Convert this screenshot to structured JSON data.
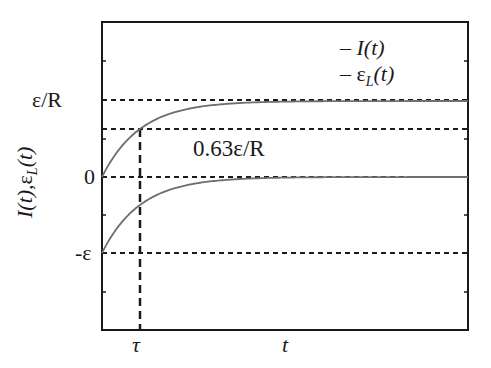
{
  "chart_data": {
    "type": "line",
    "title": "",
    "xlabel": "t",
    "ylabel": "I(t), ε_L(t)",
    "x_ticks": [
      {
        "label": "τ",
        "value": 1
      },
      {
        "label": "t",
        "value": 4
      }
    ],
    "y_ticks": [
      {
        "label": "ε/R",
        "value": 1
      },
      {
        "label": "0",
        "value": 0
      },
      {
        "label": "-ε",
        "value": -1
      }
    ],
    "xlim": [
      0,
      9.6
    ],
    "ylim": [
      -2,
      2
    ],
    "grid": false,
    "legend": {
      "position": "upper right",
      "entries": [
        "I(t)",
        "ε_L(t)"
      ]
    },
    "series": [
      {
        "name": "I(t)",
        "formula": "(ε/R)(1 - e^(-t/τ))",
        "x": [
          0,
          0.5,
          1,
          2,
          3,
          4,
          6,
          9.6
        ],
        "values": [
          0,
          0.39,
          0.63,
          0.86,
          0.95,
          0.98,
          1.0,
          1.0
        ]
      },
      {
        "name": "ε_L(t)",
        "formula": "-ε e^(-t/τ)",
        "x": [
          0,
          0.5,
          1,
          2,
          3,
          4,
          6,
          9.6
        ],
        "values": [
          -1,
          -0.61,
          -0.37,
          -0.14,
          -0.05,
          -0.02,
          0,
          0
        ]
      }
    ],
    "reference_lines": [
      {
        "orientation": "horizontal",
        "value": 1,
        "label": "ε/R",
        "style": "dashed"
      },
      {
        "orientation": "horizontal",
        "value": 0.63,
        "label": "0.63ε/R",
        "style": "dashed"
      },
      {
        "orientation": "horizontal",
        "value": 0,
        "label": "0",
        "style": "dashed"
      },
      {
        "orientation": "horizontal",
        "value": -1,
        "label": "-ε",
        "style": "dashed"
      },
      {
        "orientation": "vertical",
        "value": 1,
        "label": "τ",
        "style": "dashed"
      }
    ],
    "annotations": [
      {
        "text": "0.63ε/R",
        "x": 2.5,
        "y": 0.4
      }
    ]
  },
  "labels": {
    "y_tick_eps_r": "ε/R",
    "y_tick_zero": "0",
    "y_tick_neg_eps": "-ε",
    "x_tick_tau": "τ",
    "x_label_t": "t",
    "annotation_063": "0.63ε/R",
    "legend_dash": "–",
    "legend_I": "I(t)",
    "legend_eps": "ε",
    "legend_L": "L",
    "legend_paren_t": "(t)",
    "ylabel_I": "I(t),",
    "ylabel_eps": "ε",
    "ylabel_L": "L",
    "ylabel_t": "(t)"
  },
  "colors": {
    "curve": "#6e6e6e",
    "axis": "#1a1a1a",
    "dashed": "#1a1a1a"
  }
}
